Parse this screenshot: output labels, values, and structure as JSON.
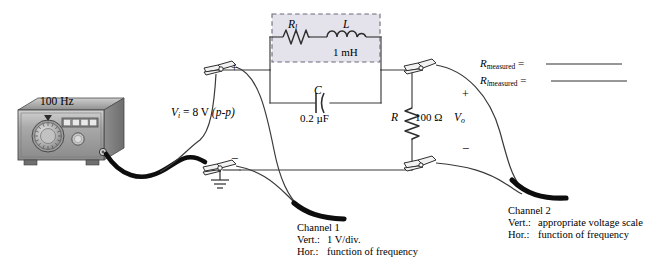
{
  "source": {
    "frequency_label": "100 Hz",
    "device": "function-generator"
  },
  "input": {
    "symbol": "V",
    "subscript": "i",
    "equals": "=",
    "value": "8 V",
    "qualifier": "(p-p)",
    "full": "V i  =  8 V (p-p)",
    "plus": "+",
    "minus": "−"
  },
  "coil_box": {
    "rl_symbol": "R",
    "rl_subscript": "l",
    "l_symbol": "L",
    "l_value": "1 mH",
    "fill_color": "#e4e2ea",
    "border": "dashed"
  },
  "capacitor": {
    "symbol": "C",
    "value": "0.2 µF"
  },
  "resistor": {
    "symbol": "R",
    "value": "100 Ω"
  },
  "output": {
    "symbol": "V",
    "subscript": "o",
    "plus": "+",
    "minus": "−"
  },
  "measurements": [
    {
      "symbol": "R",
      "subscript": "",
      "label": "measured",
      "equals": "=",
      "value": ""
    },
    {
      "symbol": "R",
      "subscript": "l",
      "label": "measured",
      "equals": "=",
      "value": ""
    }
  ],
  "channels": [
    {
      "name": "Channel 1",
      "vert_key": "Vert.:",
      "vert_value": "1 V/div.",
      "hor_key": "Hor.:",
      "hor_value": "function of frequency"
    },
    {
      "name": "Channel 2",
      "vert_key": "Vert.:",
      "vert_value": "appropriate voltage scale",
      "hor_key": "Hor.:",
      "hor_value": "function of frequency"
    }
  ],
  "colors": {
    "wire": "#3a3a3a",
    "cable": "#111111",
    "box_fill": "#e4e2ea",
    "box_border": "#6b6b7a",
    "generator_body": "#9a9a9a",
    "generator_face": "#b8b8b8",
    "paper": "#ffffff"
  }
}
